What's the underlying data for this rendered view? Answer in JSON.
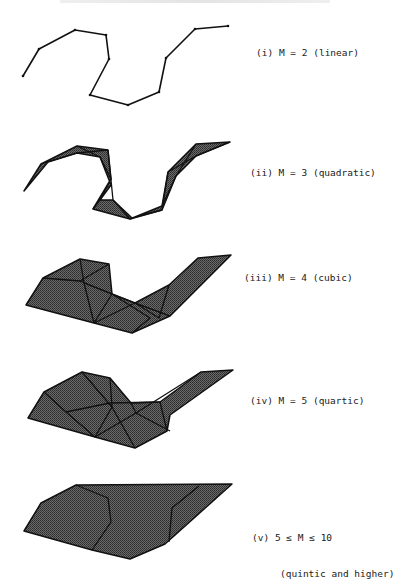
{
  "figure": {
    "header_clipped": true,
    "fill_color": "#4a4a4a",
    "stroke_color": "#111111",
    "panels": [
      {
        "id": "i",
        "label": "(i) M = 2 (linear)",
        "label_pos": [
          256,
          47
        ],
        "kind": "polyline",
        "outline": [
          [
            23,
            76
          ],
          [
            39,
            49
          ],
          [
            75,
            30
          ],
          [
            106,
            35
          ],
          [
            109,
            59
          ],
          [
            90,
            95
          ],
          [
            128,
            105
          ],
          [
            159,
            92
          ],
          [
            166,
            58
          ],
          [
            195,
            29
          ],
          [
            228,
            26
          ]
        ]
      },
      {
        "id": "ii",
        "label": "(ii) M = 3 (quadratic)",
        "label_pos": [
          250,
          167
        ],
        "kind": "strip",
        "outline": [
          [
            24,
            191
          ],
          [
            41,
            164
          ],
          [
            77,
            146
          ],
          [
            108,
            150
          ],
          [
            111,
            179
          ],
          [
            93,
            209
          ],
          [
            130,
            219
          ],
          [
            162,
            206
          ],
          [
            168,
            172
          ],
          [
            196,
            144
          ],
          [
            230,
            142
          ],
          [
            196,
            156
          ],
          [
            176,
            176
          ],
          [
            162,
            210
          ],
          [
            132,
            218
          ],
          [
            113,
            200
          ],
          [
            100,
            200
          ],
          [
            111,
            185
          ],
          [
            100,
            157
          ],
          [
            77,
            153
          ],
          [
            48,
            162
          ]
        ],
        "inner": [
          [
            [
              41,
              164
            ],
            [
              77,
              153
            ],
            [
              108,
              150
            ]
          ],
          [
            [
              77,
              146
            ],
            [
              100,
              157
            ],
            [
              111,
              179
            ]
          ],
          [
            [
              111,
              179
            ],
            [
              100,
              200
            ],
            [
              93,
              209
            ]
          ],
          [
            [
              108,
              150
            ],
            [
              113,
              200
            ],
            [
              130,
              219
            ]
          ],
          [
            [
              130,
              219
            ],
            [
              162,
              210
            ],
            [
              168,
              172
            ]
          ],
          [
            [
              162,
              206
            ],
            [
              176,
              176
            ],
            [
              196,
              144
            ]
          ],
          [
            [
              168,
              172
            ],
            [
              196,
              156
            ],
            [
              230,
              142
            ]
          ]
        ]
      },
      {
        "id": "iii",
        "label": "(iii) M = 4 (cubic)",
        "label_pos": [
          244,
          272
        ],
        "kind": "strip",
        "outline": [
          [
            26,
            305
          ],
          [
            43,
            278
          ],
          [
            80,
            259
          ],
          [
            109,
            264
          ],
          [
            112,
            294
          ],
          [
            135,
            303
          ],
          [
            169,
            285
          ],
          [
            198,
            258
          ],
          [
            231,
            255
          ],
          [
            170,
            316
          ],
          [
            132,
            333
          ],
          [
            94,
            323
          ]
        ],
        "inner": [
          [
            [
              43,
              278
            ],
            [
              80,
              281
            ],
            [
              112,
              294
            ]
          ],
          [
            [
              80,
              259
            ],
            [
              84,
              283
            ],
            [
              94,
              323
            ]
          ],
          [
            [
              80,
              281
            ],
            [
              109,
              264
            ]
          ],
          [
            [
              84,
              283
            ],
            [
              112,
              294
            ],
            [
              135,
              303
            ]
          ],
          [
            [
              94,
              323
            ],
            [
              112,
              294
            ]
          ],
          [
            [
              94,
              323
            ],
            [
              135,
              303
            ],
            [
              170,
              316
            ]
          ],
          [
            [
              112,
              294
            ],
            [
              150,
              318
            ],
            [
              132,
              333
            ]
          ],
          [
            [
              135,
              303
            ],
            [
              159,
              318
            ],
            [
              169,
              285
            ]
          ],
          [
            [
              135,
              303
            ],
            [
              170,
              316
            ]
          ]
        ]
      },
      {
        "id": "iv",
        "label": "(iv) M = 5 (quartic)",
        "label_pos": [
          250,
          395
        ],
        "kind": "strip",
        "outline": [
          [
            28,
            418
          ],
          [
            44,
            392
          ],
          [
            82,
            372
          ],
          [
            110,
            378
          ],
          [
            131,
            403
          ],
          [
            160,
            402
          ],
          [
            201,
            372
          ],
          [
            233,
            370
          ],
          [
            170,
            415
          ],
          [
            167,
            431
          ],
          [
            135,
            448
          ],
          [
            95,
            437
          ]
        ],
        "inner": [
          [
            [
              44,
              392
            ],
            [
              66,
              412
            ],
            [
              95,
              437
            ]
          ],
          [
            [
              66,
              412
            ],
            [
              110,
              403
            ],
            [
              160,
              402
            ]
          ],
          [
            [
              82,
              372
            ],
            [
              112,
              407
            ],
            [
              110,
              378
            ]
          ],
          [
            [
              112,
              407
            ],
            [
              95,
              437
            ]
          ],
          [
            [
              112,
              407
            ],
            [
              135,
              448
            ]
          ],
          [
            [
              95,
              437
            ],
            [
              136,
              413
            ],
            [
              201,
              372
            ]
          ],
          [
            [
              136,
              413
            ],
            [
              170,
              431
            ]
          ],
          [
            [
              160,
              402
            ],
            [
              167,
              431
            ]
          ],
          [
            [
              136,
              413
            ],
            [
              131,
              403
            ]
          ]
        ]
      },
      {
        "id": "v",
        "label_line1": "(v) 5 ≤ M ≤ 10",
        "label_line2": "(quintic and higher)",
        "label_pos": [
          252,
          508
        ],
        "kind": "hull",
        "outline": [
          [
            24,
            531
          ],
          [
            41,
            503
          ],
          [
            76,
            485
          ],
          [
            232,
            484
          ],
          [
            165,
            544
          ],
          [
            130,
            559
          ],
          [
            92,
            550
          ]
        ],
        "inner": [
          [
            [
              76,
              485
            ],
            [
              108,
              498
            ],
            [
              111,
              522
            ],
            [
              92,
              550
            ]
          ],
          [
            [
              199,
              486
            ],
            [
              172,
              508
            ],
            [
              169,
              542
            ]
          ]
        ]
      }
    ]
  }
}
